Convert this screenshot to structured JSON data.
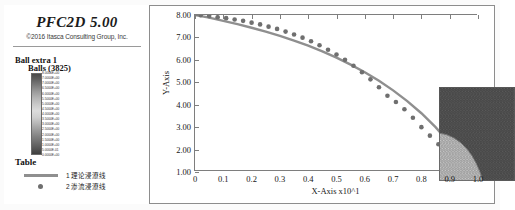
{
  "window": {
    "title": "PFC2D 5.00",
    "copyright": "©2016 Itasca Consulting Group, Inc."
  },
  "legend": {
    "group_label": "Ball extra 1",
    "balls_label": "Balls (3825)",
    "table_label": "Table",
    "colorbar_ticks": [
      "8.0000E+00",
      "7.0000E+00",
      "7.0000E+00",
      "6.5000E+00",
      "6.0000E+00",
      "5.5000E+00",
      "5.0000E+00",
      "4.5000E+00",
      "4.0000E+00",
      "3.5000E+00",
      "3.0000E+00",
      "2.5000E+00",
      "2.0000E+00",
      "1.5000E+00",
      "1.0000E+00",
      "5.0000E-01",
      "0.0000E+00"
    ],
    "items": [
      {
        "marker": "line",
        "index": "1",
        "label": "理论浸潦线"
      },
      {
        "marker": "dot",
        "index": "2",
        "label": "渗流浸潦线"
      }
    ]
  },
  "colors": {
    "line": "#8f8f8f",
    "marker": "#6f6f6f",
    "axis": "#7e7e7e",
    "frame": "#8d8d8d",
    "text": "#171717"
  },
  "chart_data": {
    "type": "line",
    "title": "",
    "xlabel": "X-Axis x10^1",
    "ylabel": "Y-Axis",
    "xlim": [
      0,
      1.0
    ],
    "ylim": [
      1.0,
      8.0
    ],
    "grid": false,
    "legend_position": "left-panel",
    "xticks": [
      "0",
      "0.1",
      "0.2",
      "0.3",
      "0.4",
      "0.5",
      "0.6",
      "0.7",
      "0.8",
      "0.9",
      "1.0"
    ],
    "xtick_values": [
      0,
      0.1,
      0.2,
      0.3,
      0.4,
      0.5,
      0.6,
      0.7,
      0.8,
      0.9,
      1.0
    ],
    "yticks": [
      "1.00",
      "2.00",
      "3.00",
      "4.00",
      "5.00",
      "6.00",
      "7.00",
      "8.00"
    ],
    "ytick_values": [
      1,
      2,
      3,
      4,
      5,
      6,
      7,
      8
    ],
    "series": [
      {
        "name": "理论浸潦线",
        "type": "line",
        "x": [
          0.0,
          0.05,
          0.1,
          0.15,
          0.2,
          0.25,
          0.3,
          0.35,
          0.4,
          0.45,
          0.5,
          0.55,
          0.6,
          0.65,
          0.7,
          0.75,
          0.8,
          0.85,
          0.9,
          0.93,
          0.96,
          0.98,
          0.99,
          1.0
        ],
        "y": [
          8.0,
          7.88,
          7.74,
          7.59,
          7.43,
          7.26,
          7.07,
          6.86,
          6.63,
          6.38,
          6.1,
          5.79,
          5.45,
          5.07,
          4.64,
          4.16,
          3.62,
          3.0,
          2.28,
          1.84,
          1.5,
          1.28,
          1.16,
          1.02
        ]
      },
      {
        "name": "渗流浸潦线",
        "type": "scatter",
        "x": [
          0.02,
          0.05,
          0.08,
          0.11,
          0.14,
          0.17,
          0.2,
          0.23,
          0.26,
          0.29,
          0.32,
          0.35,
          0.38,
          0.41,
          0.44,
          0.47,
          0.5,
          0.53,
          0.56,
          0.59,
          0.62,
          0.65,
          0.68,
          0.71,
          0.74,
          0.77,
          0.8,
          0.83,
          0.86,
          0.89,
          0.92,
          0.94,
          0.96,
          0.98,
          1.0
        ],
        "y": [
          7.99,
          7.95,
          7.9,
          7.86,
          7.8,
          7.74,
          7.66,
          7.58,
          7.48,
          7.38,
          7.26,
          7.13,
          6.99,
          6.83,
          6.65,
          6.45,
          6.24,
          6.0,
          5.74,
          5.45,
          5.13,
          4.78,
          4.4,
          4.12,
          3.8,
          3.42,
          3.0,
          2.62,
          2.24,
          1.9,
          1.6,
          1.42,
          1.28,
          1.14,
          1.05
        ]
      }
    ]
  },
  "inset": {
    "description": "particle-assembly-seepage-inset",
    "upper_color": "#5a5a5a",
    "lower_color": "#c6c6c6",
    "divider_color": "#8a8a8a"
  }
}
